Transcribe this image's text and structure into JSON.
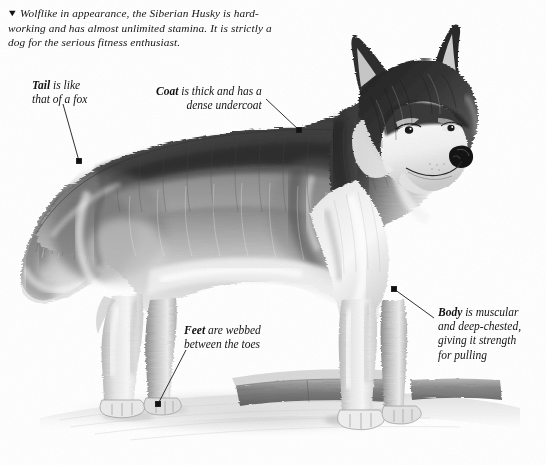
{
  "plate": {
    "width": 546,
    "height": 465,
    "background_color": "#ffffff",
    "ink_color": "#141414",
    "artwork_name": "siberian-husky-standing-side-view"
  },
  "caption": {
    "marker": "▼",
    "line1": "Wolflike in appearance, the Siberian Husky is hard-",
    "line2": "working and has almost unlimited stamina. It is strictly",
    "line3": "a dog for the serious fitness enthusiast."
  },
  "callouts": [
    {
      "id": "tail",
      "bold": "Tail",
      "line1_rest": " is like",
      "line2": "that of a fox",
      "leader": {
        "x1": 63,
        "y1": 104,
        "x2": 79,
        "y2": 161
      }
    },
    {
      "id": "coat",
      "bold": "Coat",
      "line1_rest": " is thick and has a",
      "line2": "dense undercoat",
      "leader": {
        "x1": 266,
        "y1": 99,
        "x2": 299,
        "y2": 130
      }
    },
    {
      "id": "feet",
      "bold": "Feet",
      "line1_rest": " are webbed",
      "line2": "between the toes",
      "leader": {
        "x1": 186,
        "y1": 350,
        "x2": 158,
        "y2": 404
      }
    },
    {
      "id": "body",
      "bold": "Body",
      "line1_rest": " is muscular",
      "line2": "and deep-chested,",
      "line3": "giving it strength",
      "line4": "for pulling",
      "leader": {
        "x1": 394,
        "y1": 289,
        "x2": 434,
        "y2": 318
      }
    }
  ]
}
